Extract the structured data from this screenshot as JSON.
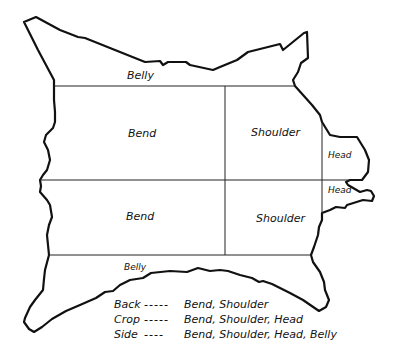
{
  "diagram": {
    "type": "hide-cutting-diagram",
    "colors": {
      "outline": "#111111",
      "background": "#ffffff"
    },
    "regions": {
      "belly_top": "Belly",
      "bend_top": "Bend",
      "shoulder_top": "Shoulder",
      "head_top": "Head",
      "head_bottom": "Head",
      "bend_bottom": "Bend",
      "shoulder_bottom": "Shoulder",
      "belly_bottom": "Belly"
    },
    "legend": [
      {
        "term": "Back",
        "dashes": "-----",
        "parts": "Bend, Shoulder"
      },
      {
        "term": "Crop",
        "dashes": "-----",
        "parts": "Bend, Shoulder, Head"
      },
      {
        "term": "Side",
        "dashes": "----",
        "parts": "Bend, Shoulder, Head, Belly"
      }
    ]
  }
}
